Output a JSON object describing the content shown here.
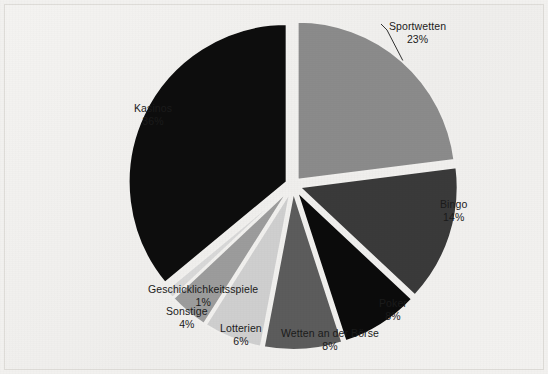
{
  "chart_data": {
    "type": "pie",
    "title": "",
    "subtitle": "",
    "xlabel": "",
    "ylabel": "",
    "legend_position": "none",
    "grid": false,
    "units": "%",
    "exploded": true,
    "start_angle_deg": 0,
    "direction": "clockwise",
    "background_color": "#f1f0ee",
    "label_color": "#1b1b1b",
    "categories": [
      "Sportwetten",
      "Bingo",
      "Poker",
      "Wetten an der Börse",
      "Lotterien",
      "Sonstige",
      "Geschicklichkeitsspiele",
      "Kasinos"
    ],
    "values": [
      23,
      14,
      8,
      8,
      6,
      4,
      1,
      36
    ],
    "colors": [
      "#8b8b8b",
      "#3a3a3a",
      "#0b0b0b",
      "#5c5c5c",
      "#cfcfcf",
      "#9c9c9c",
      "#d8d8d8",
      "#0d0d0d"
    ],
    "slices": [
      {
        "name": "Sportwetten",
        "value": 23,
        "value_label": "23%",
        "color": "#8b8b8b",
        "start_deg": 0,
        "end_deg": 82.8,
        "label_x": 389,
        "label_y": 20,
        "has_leader_line": true
      },
      {
        "name": "Bingo",
        "value": 14,
        "value_label": "14%",
        "color": "#3a3a3a",
        "start_deg": 82.8,
        "end_deg": 133.2,
        "label_x": 440,
        "label_y": 198,
        "has_leader_line": false
      },
      {
        "name": "Poker",
        "value": 8,
        "value_label": "8%",
        "color": "#0b0b0b",
        "start_deg": 133.2,
        "end_deg": 162.0,
        "label_x": 379,
        "label_y": 297,
        "has_leader_line": false
      },
      {
        "name": "Wetten an der Börse",
        "value": 8,
        "value_label": "8%",
        "color": "#5c5c5c",
        "start_deg": 162.0,
        "end_deg": 190.8,
        "label_x": 281,
        "label_y": 327,
        "has_leader_line": false
      },
      {
        "name": "Lotterien",
        "value": 6,
        "value_label": "6%",
        "color": "#cfcfcf",
        "start_deg": 190.8,
        "end_deg": 212.4,
        "label_x": 220,
        "label_y": 322,
        "has_leader_line": false
      },
      {
        "name": "Sonstige",
        "value": 4,
        "value_label": "4%",
        "color": "#9c9c9c",
        "start_deg": 212.4,
        "end_deg": 226.8,
        "label_x": 166,
        "label_y": 305,
        "has_leader_line": false
      },
      {
        "name": "Geschicklichkeitsspiele",
        "value": 1,
        "value_label": "1%",
        "color": "#d8d8d8",
        "start_deg": 226.8,
        "end_deg": 230.4,
        "label_x": 148,
        "label_y": 283,
        "has_leader_line": false
      },
      {
        "name": "Kasinos",
        "value": 36,
        "value_label": "36%",
        "color": "#0d0d0d",
        "start_deg": 230.4,
        "end_deg": 360.0,
        "label_x": 134,
        "label_y": 102,
        "has_leader_line": false
      }
    ]
  }
}
